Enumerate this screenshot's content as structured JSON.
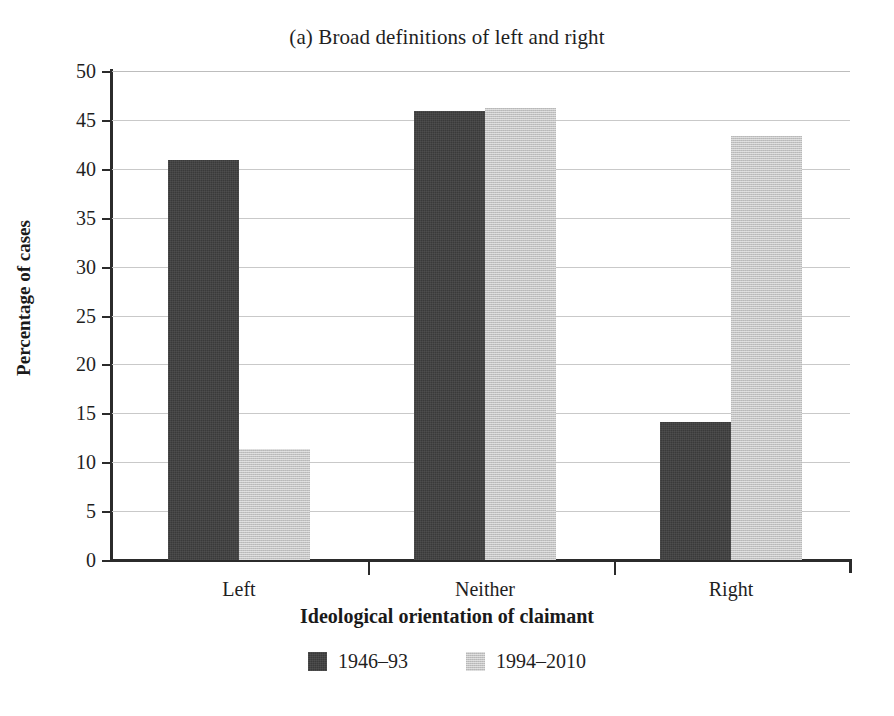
{
  "chart_data": {
    "type": "bar",
    "title": "(a) Broad definitions of left and right",
    "xlabel": "Ideological orientation of claimant",
    "ylabel": "Percentage of cases",
    "categories": [
      "Left",
      "Neither",
      "Right"
    ],
    "series": [
      {
        "name": "1946–93",
        "values": [
          40.9,
          45.9,
          14.1
        ],
        "color": "#3a3a3a"
      },
      {
        "name": "1994–2010",
        "values": [
          11.4,
          46.2,
          43.4
        ],
        "color": "#c2c2c2"
      }
    ],
    "ylim": [
      0,
      50
    ],
    "yticks": [
      0,
      5,
      10,
      15,
      20,
      25,
      30,
      35,
      40,
      45,
      50
    ],
    "ytick_labels": [
      "0",
      "5",
      "10",
      "15",
      "20",
      "25",
      "30",
      "35",
      "40",
      "45",
      "50"
    ],
    "grid": true,
    "grid_axis": "y",
    "legend_position": "bottom",
    "bar_group_spacing": true
  }
}
